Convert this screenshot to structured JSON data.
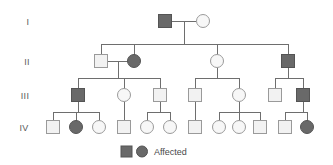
{
  "figure": {
    "type": "pedigree-chart",
    "width": 333,
    "height": 165,
    "background": "#ffffff"
  },
  "colors": {
    "affected_fill": "#696969",
    "affected_stroke": "#545454",
    "unaffected_fill": "#f2f2f2",
    "unaffected_stroke": "#9a9a9a",
    "line": "#6e6e6e",
    "label_text": "#5a5a5a",
    "legend_text": "#4a4a4a"
  },
  "generation_labels": [
    {
      "id": "gen-I",
      "text": "I",
      "x": 28,
      "y": 25
    },
    {
      "id": "gen-II",
      "text": "II",
      "x": 27,
      "y": 65
    },
    {
      "id": "gen-III",
      "text": "III",
      "x": 25,
      "y": 99
    },
    {
      "id": "gen-IV",
      "text": "IV",
      "x": 24,
      "y": 131
    }
  ],
  "legend": {
    "label": "Affected",
    "square": {
      "x": 121,
      "y": 146,
      "size": 11
    },
    "circle": {
      "cx": 142,
      "cy": 151.5,
      "r": 5.5
    },
    "text_x": 154,
    "text_y": 155
  },
  "individuals": [
    {
      "id": "I-1",
      "generation": "I",
      "sex": "male",
      "affected": true,
      "cx": 165,
      "cy": 21
    },
    {
      "id": "I-2",
      "generation": "I",
      "sex": "female",
      "affected": false,
      "cx": 203,
      "cy": 21
    },
    {
      "id": "II-1",
      "generation": "II",
      "sex": "male",
      "affected": false,
      "cx": 101,
      "cy": 61
    },
    {
      "id": "II-2",
      "generation": "II",
      "sex": "female",
      "affected": true,
      "cx": 134,
      "cy": 61
    },
    {
      "id": "II-3",
      "generation": "II",
      "sex": "female",
      "affected": false,
      "cx": 217,
      "cy": 61
    },
    {
      "id": "II-4",
      "generation": "II",
      "sex": "male",
      "affected": true,
      "cx": 288,
      "cy": 61
    },
    {
      "id": "III-1",
      "generation": "III",
      "sex": "male",
      "affected": true,
      "cx": 78,
      "cy": 95
    },
    {
      "id": "III-2",
      "generation": "III",
      "sex": "female",
      "affected": false,
      "cx": 124,
      "cy": 95
    },
    {
      "id": "III-3",
      "generation": "III",
      "sex": "male",
      "affected": false,
      "cx": 160,
      "cy": 95
    },
    {
      "id": "III-4",
      "generation": "III",
      "sex": "male",
      "affected": false,
      "cx": 195,
      "cy": 95
    },
    {
      "id": "III-5",
      "generation": "III",
      "sex": "female",
      "affected": false,
      "cx": 239,
      "cy": 95
    },
    {
      "id": "III-6",
      "generation": "III",
      "sex": "male",
      "affected": false,
      "cx": 275,
      "cy": 95
    },
    {
      "id": "III-7",
      "generation": "III",
      "sex": "male",
      "affected": true,
      "cx": 303,
      "cy": 95
    },
    {
      "id": "IV-1",
      "generation": "IV",
      "sex": "male",
      "affected": false,
      "cx": 53,
      "cy": 127
    },
    {
      "id": "IV-2",
      "generation": "IV",
      "sex": "female",
      "affected": true,
      "cx": 76,
      "cy": 127
    },
    {
      "id": "IV-3",
      "generation": "IV",
      "sex": "female",
      "affected": false,
      "cx": 99,
      "cy": 127
    },
    {
      "id": "IV-4",
      "generation": "IV",
      "sex": "male",
      "affected": false,
      "cx": 124,
      "cy": 127
    },
    {
      "id": "IV-5",
      "generation": "IV",
      "sex": "female",
      "affected": false,
      "cx": 147,
      "cy": 127
    },
    {
      "id": "IV-6",
      "generation": "IV",
      "sex": "female",
      "affected": false,
      "cx": 170,
      "cy": 127
    },
    {
      "id": "IV-7",
      "generation": "IV",
      "sex": "male",
      "affected": false,
      "cx": 195,
      "cy": 127
    },
    {
      "id": "IV-8",
      "generation": "IV",
      "sex": "female",
      "affected": false,
      "cx": 219,
      "cy": 127
    },
    {
      "id": "IV-9",
      "generation": "IV",
      "sex": "female",
      "affected": false,
      "cx": 239,
      "cy": 127
    },
    {
      "id": "IV-10",
      "generation": "IV",
      "sex": "male",
      "affected": false,
      "cx": 260,
      "cy": 127
    },
    {
      "id": "IV-11",
      "generation": "IV",
      "sex": "male",
      "affected": false,
      "cx": 285,
      "cy": 127
    },
    {
      "id": "IV-12",
      "generation": "IV",
      "sex": "female",
      "affected": true,
      "cx": 307,
      "cy": 127
    }
  ],
  "symbol_size": {
    "square": 13,
    "circle_r": 6.5
  },
  "lines": [
    {
      "id": "mate-I",
      "x1": 172,
      "y1": 21,
      "x2": 196,
      "y2": 21
    },
    {
      "id": "drop-I",
      "x1": 184,
      "y1": 21,
      "x2": 184,
      "y2": 44
    },
    {
      "id": "sib-II",
      "x1": 101,
      "y1": 44,
      "x2": 288,
      "y2": 44
    },
    {
      "id": "stub-II-1",
      "x1": 101,
      "y1": 44,
      "x2": 101,
      "y2": 55
    },
    {
      "id": "stub-II-2",
      "x1": 134,
      "y1": 44,
      "x2": 134,
      "y2": 55
    },
    {
      "id": "stub-II-3",
      "x1": 217,
      "y1": 44,
      "x2": 217,
      "y2": 55
    },
    {
      "id": "stub-II-4",
      "x1": 288,
      "y1": 44,
      "x2": 288,
      "y2": 55
    },
    {
      "id": "mate-II-a",
      "x1": 108,
      "y1": 61,
      "x2": 128,
      "y2": 61
    },
    {
      "id": "drop-II-a",
      "x1": 118,
      "y1": 61,
      "x2": 118,
      "y2": 78
    },
    {
      "id": "sib-III-a",
      "x1": 78,
      "y1": 78,
      "x2": 160,
      "y2": 78
    },
    {
      "id": "stub-III-1",
      "x1": 78,
      "y1": 78,
      "x2": 78,
      "y2": 89
    },
    {
      "id": "stub-III-2",
      "x1": 124,
      "y1": 78,
      "x2": 124,
      "y2": 89
    },
    {
      "id": "stub-III-3",
      "x1": 160,
      "y1": 78,
      "x2": 160,
      "y2": 89
    },
    {
      "id": "drop-II-3",
      "x1": 217,
      "y1": 68,
      "x2": 217,
      "y2": 78
    },
    {
      "id": "sib-III-b",
      "x1": 195,
      "y1": 78,
      "x2": 239,
      "y2": 78
    },
    {
      "id": "stub-III-4",
      "x1": 195,
      "y1": 78,
      "x2": 195,
      "y2": 89
    },
    {
      "id": "stub-III-5",
      "x1": 239,
      "y1": 78,
      "x2": 239,
      "y2": 89
    },
    {
      "id": "drop-II-4",
      "x1": 288,
      "y1": 68,
      "x2": 288,
      "y2": 78
    },
    {
      "id": "sib-III-c",
      "x1": 275,
      "y1": 78,
      "x2": 303,
      "y2": 78
    },
    {
      "id": "stub-III-6",
      "x1": 275,
      "y1": 78,
      "x2": 275,
      "y2": 89
    },
    {
      "id": "stub-III-7",
      "x1": 303,
      "y1": 78,
      "x2": 303,
      "y2": 89
    },
    {
      "id": "drop-III-1",
      "x1": 78,
      "y1": 102,
      "x2": 78,
      "y2": 112
    },
    {
      "id": "sib-IV-a",
      "x1": 53,
      "y1": 112,
      "x2": 99,
      "y2": 112
    },
    {
      "id": "stub-IV-1",
      "x1": 53,
      "y1": 112,
      "x2": 53,
      "y2": 121
    },
    {
      "id": "stub-IV-2",
      "x1": 76,
      "y1": 112,
      "x2": 76,
      "y2": 121
    },
    {
      "id": "stub-IV-3",
      "x1": 99,
      "y1": 112,
      "x2": 99,
      "y2": 121
    },
    {
      "id": "drop-III-2",
      "x1": 124,
      "y1": 102,
      "x2": 124,
      "y2": 121
    },
    {
      "id": "mate-III-3",
      "x1": 160,
      "y1": 102,
      "x2": 160,
      "y2": 112
    },
    {
      "id": "sib-IV-b",
      "x1": 147,
      "y1": 112,
      "x2": 170,
      "y2": 112
    },
    {
      "id": "stub-IV-5",
      "x1": 147,
      "y1": 112,
      "x2": 147,
      "y2": 121
    },
    {
      "id": "stub-IV-6",
      "x1": 170,
      "y1": 112,
      "x2": 170,
      "y2": 121
    },
    {
      "id": "drop-III-4",
      "x1": 195,
      "y1": 102,
      "x2": 195,
      "y2": 121
    },
    {
      "id": "drop-III-5",
      "x1": 239,
      "y1": 102,
      "x2": 239,
      "y2": 112
    },
    {
      "id": "sib-IV-c",
      "x1": 219,
      "y1": 112,
      "x2": 260,
      "y2": 112
    },
    {
      "id": "stub-IV-8",
      "x1": 219,
      "y1": 112,
      "x2": 219,
      "y2": 121
    },
    {
      "id": "stub-IV-9",
      "x1": 239,
      "y1": 112,
      "x2": 239,
      "y2": 121
    },
    {
      "id": "stub-IV-10",
      "x1": 260,
      "y1": 112,
      "x2": 260,
      "y2": 121
    },
    {
      "id": "drop-III-7",
      "x1": 303,
      "y1": 102,
      "x2": 303,
      "y2": 112
    },
    {
      "id": "sib-IV-d",
      "x1": 285,
      "y1": 112,
      "x2": 307,
      "y2": 112
    },
    {
      "id": "stub-IV-11",
      "x1": 285,
      "y1": 112,
      "x2": 285,
      "y2": 121
    },
    {
      "id": "stub-IV-12",
      "x1": 307,
      "y1": 112,
      "x2": 307,
      "y2": 121
    }
  ]
}
